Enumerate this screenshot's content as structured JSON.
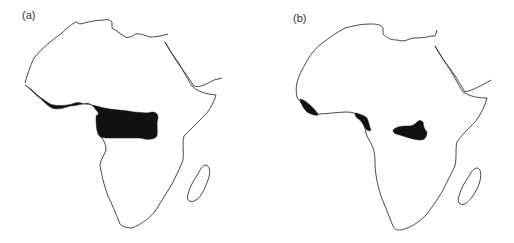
{
  "figure": {
    "panels": [
      {
        "label": "(a)",
        "description": "Outline map of Africa with a continuous shaded band across West and Central Africa",
        "shaded_regions": [
          "West African coast to Central Africa band"
        ]
      },
      {
        "label": "(b)",
        "description": "Outline map of Africa with three separate shaded patches",
        "shaded_regions": [
          "Upper Guinea coast patch",
          "Cameroon coast patch",
          "Central Congo basin patch"
        ]
      }
    ],
    "colors": {
      "outline": "#333333",
      "shading": "#111111",
      "background": "#ffffff"
    }
  }
}
